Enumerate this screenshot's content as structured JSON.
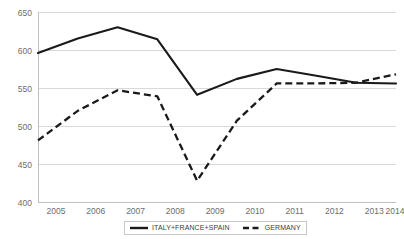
{
  "chart_data": {
    "type": "line",
    "title": "",
    "subtitle": "",
    "xlabel": "",
    "ylabel": "",
    "categories": [
      "2005",
      "2006",
      "2007",
      "2008",
      "2009",
      "2010",
      "2011",
      "2012",
      "2013",
      "2014"
    ],
    "x_tick_labels": [
      "2005",
      "2006",
      "2007",
      "2008",
      "2009",
      "2010",
      "2011",
      "2012",
      "2013",
      "2014"
    ],
    "y_tick_labels": [
      "400",
      "450",
      "500",
      "550",
      "600",
      "650"
    ],
    "y_ticks": [
      400,
      450,
      500,
      550,
      600,
      650
    ],
    "ylim": [
      400,
      650
    ],
    "grid": "horizontal",
    "legend_position": "bottom-center",
    "series": [
      {
        "name": "ITALY+FRANCE+SPAIN",
        "style": "solid",
        "color": "#1a1a1a",
        "values": [
          596,
          615,
          630,
          614,
          541,
          562,
          575,
          566,
          557,
          556
        ]
      },
      {
        "name": "GERMANY",
        "style": "dashed",
        "color": "#1a1a1a",
        "values": [
          481,
          520,
          547,
          539,
          428,
          507,
          556,
          556,
          557,
          568
        ]
      }
    ]
  },
  "legend": {
    "entries": [
      {
        "label": "ITALY+FRANCE+SPAIN",
        "style": "solid"
      },
      {
        "label": "GERMANY",
        "style": "dashed"
      }
    ]
  },
  "axes": {
    "y_labels": [
      "650",
      "600",
      "550",
      "500",
      "450",
      "400"
    ],
    "x_labels": [
      "2005",
      "2006",
      "2007",
      "2008",
      "2009",
      "2010",
      "2011",
      "2012",
      "2013",
      "2014"
    ]
  },
  "colors": {
    "series_ink": "#1a1a1a",
    "gridline": "#d9d9d9",
    "axis": "#bfbfbf",
    "tick_text": "#6d6d6d",
    "legend_border": "#c8c8c8",
    "background": "#ffffff"
  }
}
